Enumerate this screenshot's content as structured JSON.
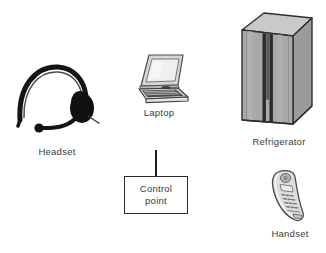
{
  "diagram": {
    "background_color": "#ffffff",
    "nodes": [
      {
        "id": "headset",
        "label": "Headset",
        "icon": "headset-icon",
        "style": "black-silhouette",
        "color": "#111111"
      },
      {
        "id": "laptop",
        "label": "Laptop",
        "icon": "laptop-icon",
        "style": "grayscale-line-drawing",
        "color": "#808080"
      },
      {
        "id": "refrigerator",
        "label": "Refrigerator",
        "icon": "refrigerator-icon",
        "style": "grayscale-3d-box",
        "color": "#9a9a9a"
      },
      {
        "id": "handset",
        "label": "Handset",
        "icon": "handset-icon",
        "style": "grayscale-line-drawing",
        "color": "#8c8c8c"
      }
    ],
    "control_point": {
      "line1": "Control",
      "line2": "point",
      "shape": "rectangle",
      "border_color": "#2b2b2b",
      "connector": "vertical-line-up"
    },
    "caption_color": "#3a3a3a"
  }
}
